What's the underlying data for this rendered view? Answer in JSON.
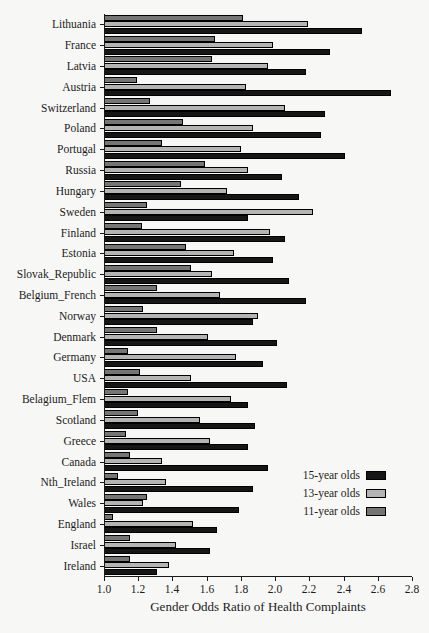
{
  "colors": {
    "background": "#f7f7f5",
    "axis": "#1a1a1a",
    "text": "#1c1c1c",
    "bar_15yr": "#161616",
    "bar_13yr": "#b4b4b4",
    "bar_11yr": "#757575"
  },
  "chart_data": {
    "type": "bar",
    "orientation": "horizontal",
    "title": "",
    "xlabel": "Gender Odds Ratio of Health Complaints",
    "ylabel": "",
    "xlim": [
      1.0,
      2.8
    ],
    "xticks": [
      "1.0",
      "1.2",
      "1.4",
      "1.6",
      "1.8",
      "2.0",
      "2.2",
      "2.4",
      "2.6",
      "2.8"
    ],
    "grid": false,
    "legend_position": "lower-right",
    "group_bar_order_top_to_bottom": [
      "11-year olds",
      "13-year olds",
      "15-year olds"
    ],
    "categories": [
      "Lithuania",
      "France",
      "Latvia",
      "Austria",
      "Switzerland",
      "Poland",
      "Portugal",
      "Russia",
      "Hungary",
      "Sweden",
      "Finland",
      "Estonia",
      "Slovak_Republic",
      "Belgium_French",
      "Norway",
      "Denmark",
      "Germany",
      "USA",
      "Belagium_Flem",
      "Scotland",
      "Greece",
      "Canada",
      "Nth_Ireland",
      "Wales",
      "England",
      "Israel",
      "Ireland"
    ],
    "series": [
      {
        "name": "15-year olds",
        "color": "#161616",
        "values": [
          2.51,
          2.32,
          2.18,
          2.68,
          2.29,
          2.27,
          2.41,
          2.04,
          2.14,
          1.84,
          2.06,
          1.99,
          2.08,
          2.18,
          1.87,
          2.01,
          1.93,
          2.07,
          1.84,
          1.88,
          1.84,
          1.96,
          1.87,
          1.79,
          1.66,
          1.62,
          1.31
        ]
      },
      {
        "name": "13-year olds",
        "color": "#b4b4b4",
        "values": [
          2.19,
          1.99,
          1.96,
          1.83,
          2.06,
          1.87,
          1.8,
          1.84,
          1.72,
          2.22,
          1.97,
          1.76,
          1.63,
          1.68,
          1.9,
          1.61,
          1.77,
          1.51,
          1.74,
          1.56,
          1.62,
          1.34,
          1.36,
          1.23,
          1.52,
          1.42,
          1.38
        ]
      },
      {
        "name": "11-year olds",
        "color": "#757575",
        "values": [
          1.81,
          1.65,
          1.63,
          1.19,
          1.27,
          1.46,
          1.34,
          1.59,
          1.45,
          1.25,
          1.22,
          1.48,
          1.51,
          1.31,
          1.23,
          1.31,
          1.14,
          1.21,
          1.14,
          1.2,
          1.13,
          1.15,
          1.08,
          1.25,
          1.05,
          1.15,
          1.15
        ]
      }
    ]
  }
}
